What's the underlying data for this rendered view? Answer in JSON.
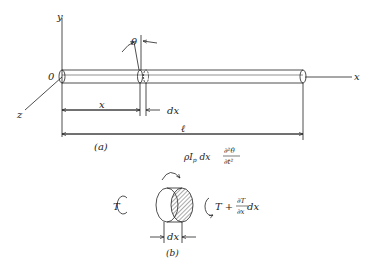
{
  "figure_a": {
    "axis_y": "y",
    "axis_x": "x",
    "axis_z": "z",
    "origin": "0",
    "angle": "θ",
    "dim_x": "x",
    "dim_dx": "dx",
    "dim_length": "ℓ",
    "caption": "(a)"
  },
  "figure_b": {
    "torque_left": "T",
    "inertia_term": "ρI",
    "inertia_sub": "p",
    "inertia_dx": " dx",
    "deriv_num": "∂²θ",
    "deriv_den": "∂t²",
    "torque_right": "T + ",
    "torque_right_num": "∂T",
    "torque_right_den": "∂x",
    "torque_right_dx": " dx",
    "dim_dx": "dx",
    "caption": "(b)"
  },
  "colors": {
    "ink": "#222222",
    "hatch": "#555555"
  }
}
